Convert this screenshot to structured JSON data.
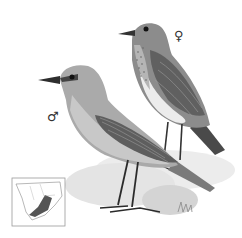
{
  "illustration": {
    "subject": "bird pair illustration",
    "female": {
      "symbol": "♀"
    },
    "male": {
      "symbol": "♂"
    },
    "map": {
      "name": "range map",
      "highlight_color": "#555555"
    },
    "colors": {
      "background": "#ffffff",
      "male_body": "#a9a9a9",
      "male_belly": "#c6c6c6",
      "female_body": "#8a8a8a",
      "female_belly": "#e8e8e8",
      "wing": "#5e5e5e",
      "ground": "#e6e6e6"
    }
  }
}
